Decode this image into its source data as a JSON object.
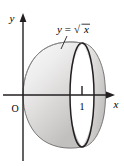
{
  "figure": {
    "type": "math-diagram",
    "background_color": "#ffffff",
    "axes": {
      "x_axis_label": "x",
      "y_axis_label": "y",
      "origin_label": "O",
      "axis_color": "#231f20",
      "x_axis_y_px": 95,
      "y_axis_x_px": 23,
      "ticks": [
        {
          "label": "1",
          "x_px": 82
        }
      ]
    },
    "curve": {
      "label": "y = √x",
      "label_text_left": "y",
      "label_text_equals": "=",
      "label_text_radical": "√",
      "label_text_arg": "x",
      "leader_line": true,
      "stroke_color": "#231f20"
    },
    "solid": {
      "vertex_x_px": 23,
      "vertex_y_px": 95,
      "cross_section_center_x_px": 82,
      "cross_section_rx_px": 12,
      "cross_section_ry_px": 52,
      "right_cap_x_px": 106,
      "fill_light": "#f2f1f0",
      "fill_mid": "#d9d7d6",
      "fill_dark": "#bdbbba",
      "outline_color": "#231f20"
    }
  }
}
